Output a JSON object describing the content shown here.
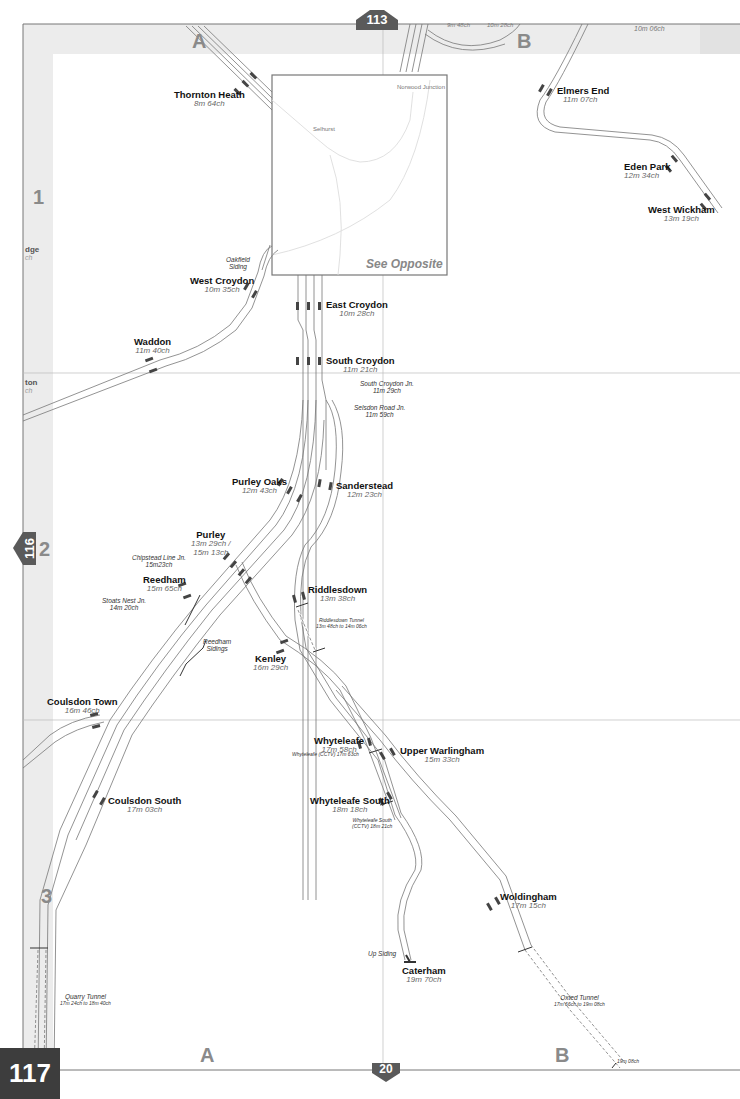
{
  "page": {
    "number": "117",
    "adjacent_pages": {
      "north": "113",
      "west": "116",
      "south": "20"
    }
  },
  "grid": {
    "columns": [
      "A",
      "B"
    ],
    "rows": [
      "1",
      "2",
      "3"
    ]
  },
  "inset": {
    "label": "See Opposite",
    "stations": [
      "Norwood Junction",
      "Selhurst"
    ]
  },
  "stations": [
    {
      "name": "Thornton Heath",
      "mileage": "8m 64ch"
    },
    {
      "name": "Elmers End",
      "mileage": "11m 07ch"
    },
    {
      "name": "Eden Park",
      "mileage": "12m 34ch"
    },
    {
      "name": "West Wickham",
      "mileage": "13m 19ch"
    },
    {
      "name": "West Croydon",
      "mileage": "10m 35ch"
    },
    {
      "name": "East Croydon",
      "mileage": "10m 28ch"
    },
    {
      "name": "Waddon",
      "mileage": "11m 40ch"
    },
    {
      "name": "South Croydon",
      "mileage": "11m 21ch"
    },
    {
      "name": "Purley Oaks",
      "mileage": "12m 43ch"
    },
    {
      "name": "Sanderstead",
      "mileage": "12m 23ch"
    },
    {
      "name": "Purley",
      "mileage": "13m 29ch /",
      "mileage2": "15m 13ch"
    },
    {
      "name": "Reedham",
      "mileage": "15m 65ch"
    },
    {
      "name": "Riddlesdown",
      "mileage": "13m 38ch"
    },
    {
      "name": "Kenley",
      "mileage": "16m 29ch"
    },
    {
      "name": "Coulsdon Town",
      "mileage": "16m 46ch"
    },
    {
      "name": "Whyteleafe",
      "mileage": "17m 58ch"
    },
    {
      "name": "Upper Warlingham",
      "mileage": "15m 33ch"
    },
    {
      "name": "Coulsdon South",
      "mileage": "17m 03ch"
    },
    {
      "name": "Whyteleafe South",
      "mileage": "18m 18ch"
    },
    {
      "name": "Woldingham",
      "mileage": "17m 15ch"
    },
    {
      "name": "Caterham",
      "mileage": "19m 70ch"
    }
  ],
  "notes": {
    "oakfield_siding": [
      "Oakfield",
      "Siding"
    ],
    "south_croydon_jn": [
      "South Croydon Jn.",
      "11m 29ch"
    ],
    "selsdon_road_jn": [
      "Selsdon Road Jn.",
      "11m 59ch"
    ],
    "chipstead_line_jn": [
      "Chipstead Line Jn.",
      "15m23ch"
    ],
    "stoats_nest_jn": [
      "Stoats Nest Jn.",
      "14m 20ch"
    ],
    "reedham_sidings": [
      "Reedham",
      "Sidings"
    ],
    "riddlesdown_tunnel": [
      "Riddlesdown Tunnel",
      "13m 48ch to 14m 06ch"
    ],
    "whyteleafe_cctv": "Whyteleafe (CCTV) 17m 63ch",
    "whyteleafe_south_cctv": [
      "Whyteleafe South",
      "(CCTV) 18m 21ch"
    ],
    "up_siding": "Up Siding",
    "quarry_tunnel": [
      "Quarry Tunnel",
      "17m 24ch to 18m 40ch"
    ],
    "oxted_tunnel": [
      "Oxted Tunnel",
      "17m 66ch to 19m 08ch"
    ],
    "boundary_mileage": "19m 08ch"
  },
  "edge_fragments": {
    "top": [
      "9m 48ch",
      "10m 28ch",
      "10m 06ch"
    ],
    "left": [
      "dge",
      "ch",
      "ton",
      "ch"
    ]
  },
  "colors": {
    "track": "#666666",
    "platform": "#444444",
    "page_tab": "#5a5a5a",
    "margin_band": "#ececec",
    "grid_line": "#b8b8b8",
    "label_grey": "#888888"
  }
}
